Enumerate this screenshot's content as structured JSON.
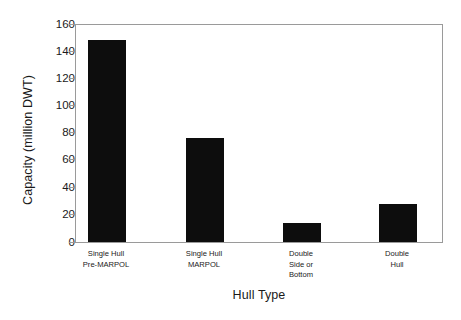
{
  "chart_data": {
    "type": "bar",
    "title": "",
    "subtitle": "",
    "xlabel": "Hull Type",
    "ylabel": "Capacity (million DWT)",
    "categories": [
      "Single Hull\nPre-MARPOL",
      "Single Hull\nMARPOL",
      "Double\nSide or\nBottom",
      "Double\nHull"
    ],
    "category_lines": [
      [
        "Single Hull",
        "Pre-MARPOL"
      ],
      [
        "Single Hull",
        "MARPOL"
      ],
      [
        "Double",
        "Side or",
        "Bottom"
      ],
      [
        "Double",
        "Hull"
      ]
    ],
    "values": [
      149,
      77,
      14,
      28
    ],
    "series": [
      {
        "name": "Capacity",
        "values": [
          149,
          77,
          14,
          28
        ]
      }
    ],
    "ylim": [
      0,
      160
    ],
    "xlim": [
      0,
      4
    ],
    "ytick_labels": [
      "0",
      "20",
      "40",
      "60",
      "80",
      "100",
      "120",
      "140",
      "160"
    ],
    "ytick_values": [
      0,
      20,
      40,
      60,
      80,
      100,
      120,
      140,
      160
    ],
    "ytick_step": 20,
    "xtick_labels": [],
    "grid": false,
    "legend": false,
    "legend_position": "none",
    "annotations": [],
    "colors": {
      "bar_fill": "#0d0d0d",
      "axis_line": "#9a9a9a",
      "text": "#1a1a1a",
      "background": "#ffffff"
    }
  }
}
